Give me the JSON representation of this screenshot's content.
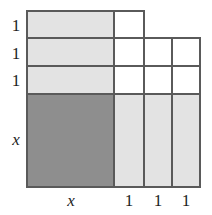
{
  "figure": {
    "type": "area-model-diagram",
    "colors": {
      "dark_fill": "#8e8e8e",
      "light_fill": "#e3e3e3",
      "empty_fill": "#ffffff",
      "stroke": "#5a5a5a",
      "text": "#1d1d1d",
      "background": "#ffffff"
    },
    "geometry": {
      "left": 27,
      "top": 11,
      "bottom": 187,
      "column_edges": [
        27,
        114,
        144,
        172,
        200
      ],
      "row_edges": [
        11,
        38,
        66,
        94,
        187
      ],
      "stroke_width": 2
    },
    "row_labels": [
      {
        "text": "1",
        "style": "number"
      },
      {
        "text": "1",
        "style": "number"
      },
      {
        "text": "1",
        "style": "number"
      },
      {
        "text": "x",
        "style": "variable"
      }
    ],
    "column_labels": [
      {
        "text": "x",
        "style": "variable"
      },
      {
        "text": "1",
        "style": "number"
      },
      {
        "text": "1",
        "style": "number"
      },
      {
        "text": "1",
        "style": "number"
      }
    ],
    "cells": [
      {
        "id": "r1c1",
        "row": 1,
        "col": 1,
        "x": 27,
        "y": 11,
        "w": 87,
        "h": 27,
        "fill": "light",
        "area": "x·1"
      },
      {
        "id": "r1c2",
        "row": 1,
        "col": 2,
        "x": 114,
        "y": 11,
        "w": 30,
        "h": 27,
        "fill": "empty",
        "area": "1·1"
      },
      {
        "id": "r2c1",
        "row": 2,
        "col": 1,
        "x": 27,
        "y": 38,
        "w": 87,
        "h": 28,
        "fill": "light",
        "area": "x·1"
      },
      {
        "id": "r2c2",
        "row": 2,
        "col": 2,
        "x": 114,
        "y": 38,
        "w": 30,
        "h": 28,
        "fill": "empty",
        "area": "1·1"
      },
      {
        "id": "r2c3",
        "row": 2,
        "col": 3,
        "x": 144,
        "y": 38,
        "w": 28,
        "h": 28,
        "fill": "empty",
        "area": "1·1"
      },
      {
        "id": "r2c4",
        "row": 2,
        "col": 4,
        "x": 172,
        "y": 38,
        "w": 28,
        "h": 28,
        "fill": "empty",
        "area": "1·1"
      },
      {
        "id": "r3c1",
        "row": 3,
        "col": 1,
        "x": 27,
        "y": 66,
        "w": 87,
        "h": 28,
        "fill": "light",
        "area": "x·1"
      },
      {
        "id": "r3c2",
        "row": 3,
        "col": 2,
        "x": 114,
        "y": 66,
        "w": 30,
        "h": 28,
        "fill": "empty",
        "area": "1·1"
      },
      {
        "id": "r3c3",
        "row": 3,
        "col": 3,
        "x": 144,
        "y": 66,
        "w": 28,
        "h": 28,
        "fill": "empty",
        "area": "1·1"
      },
      {
        "id": "r3c4",
        "row": 3,
        "col": 4,
        "x": 172,
        "y": 66,
        "w": 28,
        "h": 28,
        "fill": "empty",
        "area": "1·1"
      },
      {
        "id": "r4c1",
        "row": 4,
        "col": 1,
        "x": 27,
        "y": 94,
        "w": 87,
        "h": 93,
        "fill": "dark",
        "area": "x·x"
      },
      {
        "id": "r4c2",
        "row": 4,
        "col": 2,
        "x": 114,
        "y": 94,
        "w": 30,
        "h": 93,
        "fill": "light",
        "area": "1·x"
      },
      {
        "id": "r4c3",
        "row": 4,
        "col": 3,
        "x": 144,
        "y": 94,
        "w": 28,
        "h": 93,
        "fill": "light",
        "area": "1·x"
      },
      {
        "id": "r4c4",
        "row": 4,
        "col": 4,
        "x": 172,
        "y": 94,
        "w": 28,
        "h": 93,
        "fill": "light",
        "area": "1·x"
      }
    ],
    "outline_paths": [
      "M 27 11 L 144 11 L 144 38 L 200 38 L 200 187 L 27 187 Z"
    ],
    "inner_lines": [
      {
        "orientation": "horizontal",
        "x1": 27,
        "y1": 38,
        "x2": 144,
        "y2": 38
      },
      {
        "orientation": "horizontal",
        "x1": 27,
        "y1": 66,
        "x2": 200,
        "y2": 66
      },
      {
        "orientation": "horizontal",
        "x1": 27,
        "y1": 94,
        "x2": 200,
        "y2": 94
      },
      {
        "orientation": "vertical",
        "x1": 114,
        "y1": 11,
        "x2": 114,
        "y2": 187
      },
      {
        "orientation": "vertical",
        "x1": 144,
        "y1": 11,
        "x2": 144,
        "y2": 187
      },
      {
        "orientation": "vertical",
        "x1": 172,
        "y1": 38,
        "x2": 172,
        "y2": 187
      }
    ]
  }
}
